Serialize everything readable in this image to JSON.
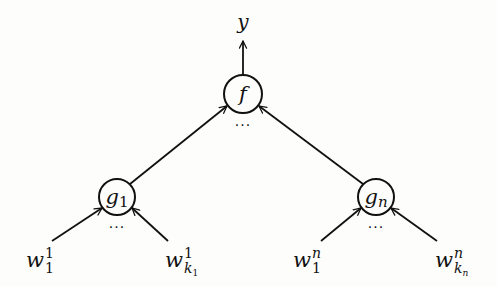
{
  "diagram": {
    "type": "tree-network",
    "stroke_color": "#111111",
    "background": "#fdfdfc",
    "output": {
      "label": "y"
    },
    "top_node": {
      "label": "f",
      "ellipsis": "···"
    },
    "children": [
      {
        "label": "g",
        "label_sub": "1",
        "ellipsis": "···",
        "inputs": [
          {
            "base": "w",
            "sup": "1",
            "sub": "1",
            "sub_sub": ""
          },
          {
            "base": "w",
            "sup": "1",
            "sub": "k",
            "sub_sub": "1"
          }
        ]
      },
      {
        "label": "g",
        "label_sub": "n",
        "ellipsis": "···",
        "inputs": [
          {
            "base": "w",
            "sup": "n",
            "sub": "1",
            "sub_sub": ""
          },
          {
            "base": "w",
            "sup": "n",
            "sub": "k",
            "sub_sub": "n"
          }
        ]
      }
    ]
  }
}
